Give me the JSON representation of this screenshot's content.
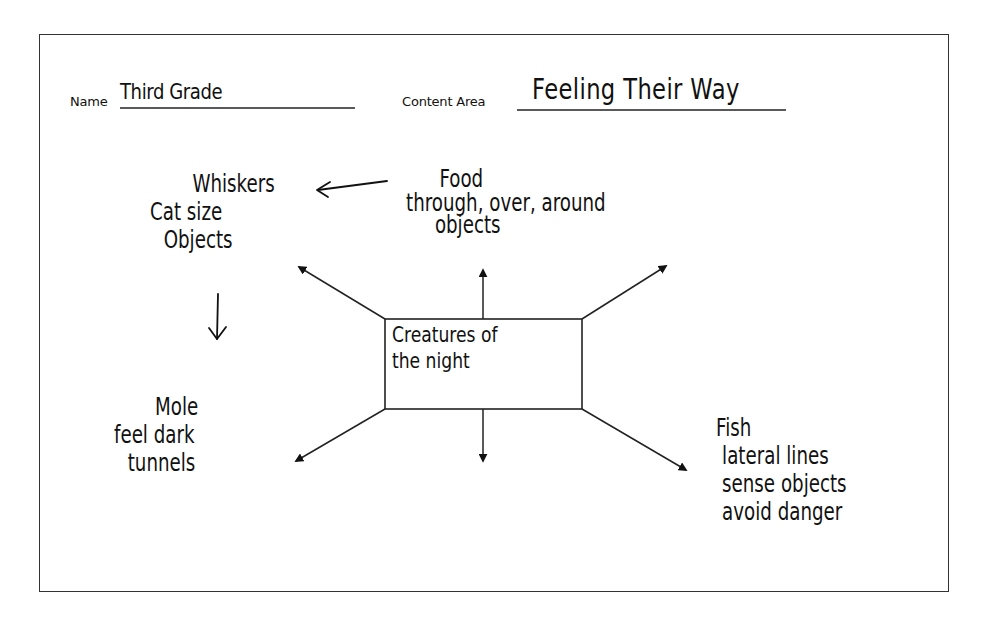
{
  "worksheet": {
    "name_label": "Name",
    "name_value": "Third Grade",
    "content_area_label": "Content Area",
    "content_area_value": "Feeling Their Way"
  },
  "diagram": {
    "type": "concept-web",
    "center": {
      "lines": [
        "Creatures of",
        "the night"
      ]
    },
    "nodes": [
      {
        "id": "whiskers",
        "position": "upper-left",
        "lines": [
          "Whiskers",
          "Cat size",
          "Objects"
        ]
      },
      {
        "id": "food",
        "position": "top",
        "lines": [
          "Food",
          "through, over, around",
          "objects"
        ]
      },
      {
        "id": "mole",
        "position": "lower-left",
        "lines": [
          "Mole",
          "feel dark",
          "tunnels"
        ]
      },
      {
        "id": "fish",
        "position": "lower-right",
        "lines": [
          "Fish",
          "lateral lines",
          "sense objects",
          "avoid danger"
        ]
      }
    ],
    "arrows": [
      {
        "from": "center",
        "direction": "up"
      },
      {
        "from": "center",
        "direction": "up-left"
      },
      {
        "from": "center",
        "direction": "up-right"
      },
      {
        "from": "center",
        "direction": "down"
      },
      {
        "from": "center",
        "direction": "down-left"
      },
      {
        "from": "center",
        "direction": "down-right"
      },
      {
        "from": "food",
        "to": "whiskers",
        "style": "hand-drawn"
      },
      {
        "from": "whiskers",
        "to": "mole",
        "style": "hand-drawn"
      }
    ]
  }
}
